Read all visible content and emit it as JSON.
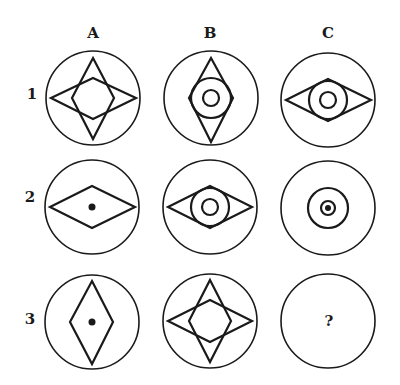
{
  "puzzle": {
    "columns": [
      {
        "label": "A"
      },
      {
        "label": "B"
      },
      {
        "label": "C"
      }
    ],
    "rows": [
      {
        "label": "1"
      },
      {
        "label": "2"
      },
      {
        "label": "3"
      }
    ],
    "cells": {
      "A1": {
        "contents": [
          "vertical-diamond",
          "horizontal-diamond"
        ]
      },
      "B1": {
        "contents": [
          "vertical-diamond",
          "medium-circle",
          "small-circle"
        ]
      },
      "C1": {
        "contents": [
          "horizontal-diamond",
          "medium-circle",
          "small-circle"
        ]
      },
      "A2": {
        "contents": [
          "horizontal-diamond",
          "dot"
        ]
      },
      "B2": {
        "contents": [
          "horizontal-diamond",
          "medium-circle",
          "small-circle"
        ]
      },
      "C2": {
        "contents": [
          "medium-circle",
          "small-circle",
          "dot"
        ]
      },
      "A3": {
        "contents": [
          "vertical-diamond",
          "dot"
        ]
      },
      "B3": {
        "contents": [
          "vertical-diamond",
          "horizontal-diamond"
        ]
      },
      "C3": {
        "contents": [
          "question-mark"
        ],
        "text": "?"
      }
    }
  }
}
